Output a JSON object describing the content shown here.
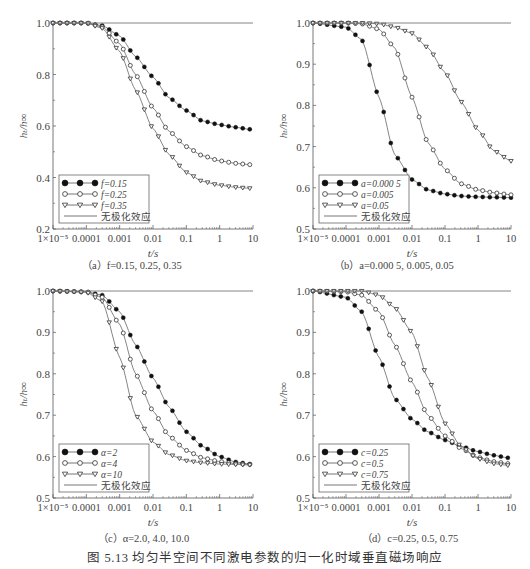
{
  "figure": {
    "title": "图 5.13   均匀半空间不同激电参数的归一化时域垂直磁场响应"
  },
  "panels": [
    {
      "id": "a",
      "caption": "（a）f=0.15, 0.25, 0.35",
      "ylabel": "h_t / h_∞",
      "xlabel": "t/s",
      "ylim": [
        0.2,
        1.0
      ],
      "yticks": [
        "0.2",
        "0.4",
        "0.6",
        "0.8",
        "1.0"
      ],
      "ytick_values": [
        0.2,
        0.4,
        0.6,
        0.8,
        1.0
      ],
      "xticks": [
        "1×10⁻⁵",
        "0.0001",
        "0.001",
        "0.01",
        "0.1",
        "1",
        "10"
      ],
      "legend": [
        "f=0.15",
        "f=0.25",
        "f=0.35",
        "无极化效应"
      ]
    },
    {
      "id": "b",
      "caption": "（b）a=0.000 5, 0.005, 0.05",
      "ylabel": "h_t / h_∞",
      "xlabel": "t/s",
      "ylim": [
        0.5,
        1.0
      ],
      "yticks": [
        "0.5",
        "0.6",
        "0.7",
        "0.8",
        "0.9",
        "1.0"
      ],
      "ytick_values": [
        0.5,
        0.6,
        0.7,
        0.8,
        0.9,
        1.0
      ],
      "xticks": [
        "1×10⁻⁵",
        "0.0001",
        "0.001",
        "0.01",
        "0.1",
        "1",
        "10"
      ],
      "legend": [
        "a=0.000 5",
        "a=0.005",
        "a=0.05",
        "无极化效应"
      ]
    },
    {
      "id": "c",
      "caption": "（c）α=2.0, 4.0, 10.0",
      "ylabel": "h_t / h_∞",
      "xlabel": "t/s",
      "ylim": [
        0.5,
        1.0
      ],
      "yticks": [
        "0.5",
        "0.6",
        "0.7",
        "0.8",
        "0.9",
        "1.0"
      ],
      "ytick_values": [
        0.5,
        0.6,
        0.7,
        0.8,
        0.9,
        1.0
      ],
      "xticks": [
        "1×10⁻⁵",
        "0.0001",
        "0.001",
        "0.01",
        "0.1",
        "1",
        "10"
      ],
      "legend": [
        "α=2",
        "α=4",
        "α=10",
        "无极化效应"
      ]
    },
    {
      "id": "d",
      "caption": "（d）c=0.25, 0.5, 0.75",
      "ylabel": "h_t / h_∞",
      "xlabel": "t/s",
      "ylim": [
        0.5,
        1.0
      ],
      "yticks": [
        "0.5",
        "0.6",
        "0.7",
        "0.8",
        "0.9",
        "1.0"
      ],
      "ytick_values": [
        0.5,
        0.6,
        0.7,
        0.8,
        0.9,
        1.0
      ],
      "xticks": [
        "1×10⁻⁵",
        "0.0001",
        "0.001",
        "0.01",
        "0.1",
        "1",
        "10"
      ],
      "legend": [
        "c=0.25",
        "c=0.5",
        "c=0.75",
        "无极化效应"
      ]
    }
  ],
  "chart_data": [
    {
      "type": "line",
      "title": "(a) f=0.15, 0.25, 0.35",
      "xlabel": "t/s",
      "ylabel": "h_t/h_∞",
      "xscale": "log",
      "xlim": [
        1e-05,
        10
      ],
      "ylim": [
        0.2,
        1.0
      ],
      "x": [
        1e-05,
        0.0001,
        0.0003,
        0.001,
        0.003,
        0.01,
        0.03,
        0.1,
        0.3,
        1,
        3,
        8
      ],
      "series": [
        {
          "name": "f=0.15",
          "marker": "filled-circle",
          "values": [
            1.0,
            1.0,
            0.99,
            0.95,
            0.87,
            0.79,
            0.71,
            0.66,
            0.62,
            0.605,
            0.595,
            0.587
          ]
        },
        {
          "name": "f=0.25",
          "marker": "open-circle",
          "values": [
            1.0,
            1.0,
            0.985,
            0.92,
            0.8,
            0.67,
            0.58,
            0.52,
            0.485,
            0.465,
            0.455,
            0.45
          ]
        },
        {
          "name": "f=0.35",
          "marker": "open-triangle",
          "values": [
            1.0,
            1.0,
            0.98,
            0.89,
            0.74,
            0.59,
            0.49,
            0.42,
            0.385,
            0.37,
            0.362,
            0.358
          ]
        },
        {
          "name": "无极化效应",
          "marker": "none",
          "values": [
            1.0,
            1.0,
            1.0,
            1.0,
            1.0,
            1.0,
            1.0,
            1.0,
            1.0,
            1.0,
            1.0,
            1.0
          ]
        }
      ],
      "legend_position": "lower-left"
    },
    {
      "type": "line",
      "title": "(b) a=0.000 5, 0.005, 0.05",
      "xlabel": "t/s",
      "ylabel": "h_t/h_∞",
      "xscale": "log",
      "xlim": [
        1e-05,
        10
      ],
      "ylim": [
        0.5,
        1.0
      ],
      "x": [
        1e-05,
        0.0001,
        0.0003,
        0.001,
        0.003,
        0.01,
        0.03,
        0.1,
        0.3,
        1,
        3,
        10
      ],
      "series": [
        {
          "name": "a=0.000 5",
          "marker": "filled-circle",
          "values": [
            1.0,
            0.99,
            0.96,
            0.82,
            0.68,
            0.62,
            0.595,
            0.585,
            0.58,
            0.578,
            0.577,
            0.576
          ]
        },
        {
          "name": "a=0.005",
          "marker": "open-circle",
          "values": [
            1.0,
            1.0,
            0.998,
            0.985,
            0.94,
            0.82,
            0.71,
            0.645,
            0.61,
            0.595,
            0.588,
            0.583
          ]
        },
        {
          "name": "a=0.05",
          "marker": "open-triangle",
          "values": [
            1.0,
            1.0,
            1.0,
            0.998,
            0.99,
            0.975,
            0.94,
            0.88,
            0.81,
            0.74,
            0.69,
            0.665
          ]
        },
        {
          "name": "无极化效应",
          "marker": "none",
          "values": [
            1.0,
            1.0,
            1.0,
            1.0,
            1.0,
            1.0,
            1.0,
            1.0,
            1.0,
            1.0,
            1.0,
            1.0
          ]
        }
      ],
      "legend_position": "lower-left"
    },
    {
      "type": "line",
      "title": "(c) α=2.0, 4.0, 10.0",
      "xlabel": "t/s",
      "ylabel": "h_t/h_∞",
      "xscale": "log",
      "xlim": [
        1e-05,
        10
      ],
      "ylim": [
        0.5,
        1.0
      ],
      "x": [
        1e-05,
        0.0001,
        0.0003,
        0.001,
        0.003,
        0.01,
        0.03,
        0.1,
        0.3,
        1,
        3,
        8
      ],
      "series": [
        {
          "name": "α=2",
          "marker": "filled-circle",
          "values": [
            1.0,
            0.998,
            0.99,
            0.95,
            0.87,
            0.79,
            0.72,
            0.66,
            0.625,
            0.6,
            0.587,
            0.582
          ]
        },
        {
          "name": "α=4",
          "marker": "open-circle",
          "values": [
            1.0,
            0.998,
            0.985,
            0.92,
            0.8,
            0.71,
            0.65,
            0.615,
            0.597,
            0.588,
            0.583,
            0.581
          ]
        },
        {
          "name": "α=10",
          "marker": "open-triangle",
          "values": [
            1.0,
            0.997,
            0.975,
            0.84,
            0.7,
            0.635,
            0.605,
            0.59,
            0.585,
            0.582,
            0.581,
            0.58
          ]
        },
        {
          "name": "无极化效应",
          "marker": "none",
          "values": [
            1.0,
            1.0,
            1.0,
            1.0,
            1.0,
            1.0,
            1.0,
            1.0,
            1.0,
            1.0,
            1.0,
            1.0
          ]
        }
      ],
      "legend_position": "lower-left"
    },
    {
      "type": "line",
      "title": "(d) c=0.25, 0.5, 0.75",
      "xlabel": "t/s",
      "ylabel": "h_t/h_∞",
      "xscale": "log",
      "xlim": [
        1e-05,
        10
      ],
      "ylim": [
        0.5,
        1.0
      ],
      "x": [
        1e-05,
        0.0001,
        0.0003,
        0.001,
        0.003,
        0.01,
        0.03,
        0.1,
        0.3,
        1,
        3,
        8
      ],
      "series": [
        {
          "name": "c=0.25",
          "marker": "filled-circle",
          "values": [
            1.0,
            0.985,
            0.95,
            0.84,
            0.74,
            0.69,
            0.66,
            0.64,
            0.625,
            0.612,
            0.603,
            0.597
          ]
        },
        {
          "name": "c=0.5",
          "marker": "open-circle",
          "values": [
            1.0,
            0.998,
            0.99,
            0.95,
            0.87,
            0.78,
            0.7,
            0.65,
            0.62,
            0.598,
            0.588,
            0.583
          ]
        },
        {
          "name": "c=0.75",
          "marker": "open-triangle",
          "values": [
            1.0,
            1.0,
            1.0,
            0.99,
            0.96,
            0.9,
            0.79,
            0.68,
            0.625,
            0.595,
            0.583,
            0.579
          ]
        },
        {
          "name": "无极化效应",
          "marker": "none",
          "values": [
            1.0,
            1.0,
            1.0,
            1.0,
            1.0,
            1.0,
            1.0,
            1.0,
            1.0,
            1.0,
            1.0,
            1.0
          ]
        }
      ],
      "legend_position": "lower-left"
    }
  ],
  "layout": {
    "plots": [
      {
        "x0": 53,
        "x1": 253,
        "y0": 23,
        "y1": 229
      },
      {
        "x0": 313,
        "x1": 511,
        "y0": 23,
        "y1": 229
      },
      {
        "x0": 53,
        "x1": 253,
        "y0": 291,
        "y1": 498
      },
      {
        "x0": 313,
        "x1": 511,
        "y0": 291,
        "y1": 498
      }
    ]
  }
}
